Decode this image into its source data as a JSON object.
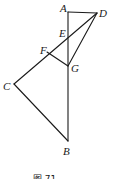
{
  "figure": {
    "caption": "图 71",
    "points": [
      {
        "id": "A",
        "label": "A"
      },
      {
        "id": "B",
        "label": "B"
      },
      {
        "id": "C",
        "label": "C"
      },
      {
        "id": "D",
        "label": "D"
      },
      {
        "id": "E",
        "label": "E"
      },
      {
        "id": "F",
        "label": "F"
      },
      {
        "id": "G",
        "label": "G"
      }
    ],
    "segments": [
      [
        "A",
        "D"
      ],
      [
        "A",
        "B"
      ],
      [
        "D",
        "C"
      ],
      [
        "D",
        "G"
      ],
      [
        "F",
        "G"
      ],
      [
        "C",
        "B"
      ]
    ],
    "relations": [
      "E lies on AB and DC",
      "F lies on DC",
      "G lies on AB"
    ]
  }
}
